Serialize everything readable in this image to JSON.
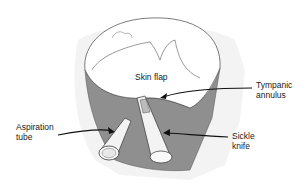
{
  "diagram": {
    "labels": {
      "skin_flap": "Skin flap",
      "tympanic_annulus_line1": "Tympanic",
      "tympanic_annulus_line2": "annulus",
      "aspiration_tube_line1": "Aspiration",
      "aspiration_tube_line2": "tube",
      "sickle_knife_line1": "Sickle",
      "sickle_knife_line2": "knife"
    },
    "colors": {
      "canal_wall": "#8f8f8f",
      "outline": "#333333",
      "background": "#ffffff",
      "hatching": "#cfcfcf"
    }
  }
}
